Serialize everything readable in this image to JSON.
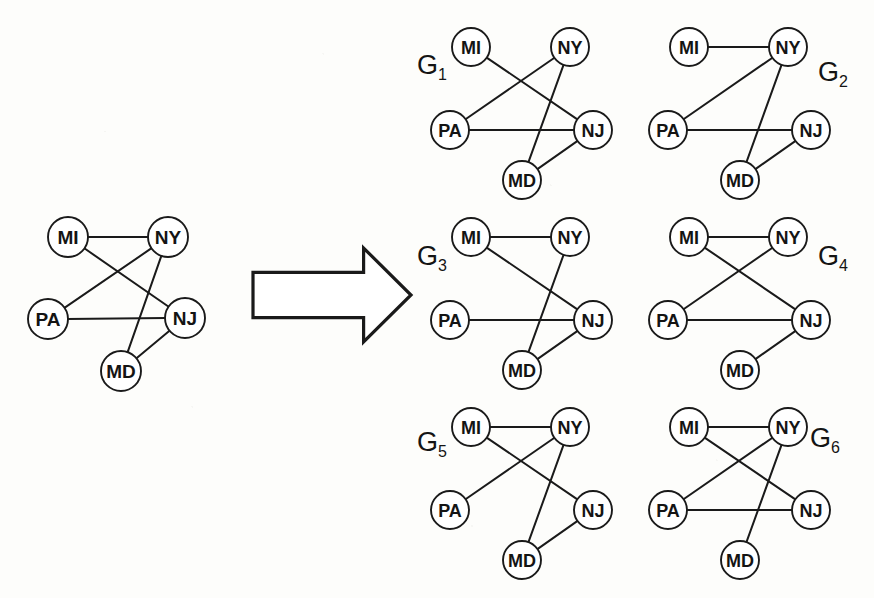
{
  "figure": {
    "background_color": "#fdfdfb",
    "ink_color": "#1a1a1a",
    "node_fill": "#ffffff",
    "node_radius": 20,
    "node_radius_small": 19
  },
  "arrow": {
    "name": "block-arrow-right",
    "label": "",
    "x": 253,
    "y": 248,
    "width": 158,
    "height": 94
  },
  "nodes": {
    "MI": "MI",
    "NY": "NY",
    "PA": "PA",
    "NJ": "NJ",
    "MD": "MD"
  },
  "layout_source": {
    "MI": [
      68,
      237
    ],
    "NY": [
      168,
      237
    ],
    "PA": [
      48,
      319
    ],
    "NJ": [
      185,
      318
    ],
    "MD": [
      121,
      371
    ]
  },
  "layout_small": {
    "MI": [
      52,
      34
    ],
    "NY": [
      151,
      34
    ],
    "PA": [
      31,
      117
    ],
    "NJ": [
      174,
      117
    ],
    "MD": [
      103,
      167
    ]
  },
  "source_graph": {
    "name": "source-graph",
    "label": "",
    "origin": [
      0,
      0
    ],
    "edges": [
      [
        "MI",
        "NY"
      ],
      [
        "MI",
        "NJ"
      ],
      [
        "PA",
        "NY"
      ],
      [
        "PA",
        "NJ"
      ],
      [
        "NY",
        "MD"
      ],
      [
        "NJ",
        "MD"
      ]
    ]
  },
  "result_graphs": [
    {
      "id": "G1",
      "label_main": "G",
      "label_sub": "1",
      "label_pos": [
        432,
        74
      ],
      "origin": [
        419,
        13
      ],
      "deleted_edge": [
        "MI",
        "NY"
      ],
      "edges": [
        [
          "MI",
          "NJ"
        ],
        [
          "PA",
          "NY"
        ],
        [
          "PA",
          "NJ"
        ],
        [
          "NY",
          "MD"
        ],
        [
          "NJ",
          "MD"
        ]
      ]
    },
    {
      "id": "G2",
      "label_main": "G",
      "label_sub": "2",
      "label_pos": [
        833,
        81
      ],
      "origin": [
        637,
        13
      ],
      "deleted_edge": [
        "MI",
        "NJ"
      ],
      "edges": [
        [
          "MI",
          "NY"
        ],
        [
          "PA",
          "NY"
        ],
        [
          "PA",
          "NJ"
        ],
        [
          "NY",
          "MD"
        ],
        [
          "NJ",
          "MD"
        ]
      ]
    },
    {
      "id": "G3",
      "label_main": "G",
      "label_sub": "3",
      "label_pos": [
        432,
        265
      ],
      "origin": [
        419,
        203
      ],
      "deleted_edge": [
        "PA",
        "NY"
      ],
      "edges": [
        [
          "MI",
          "NY"
        ],
        [
          "MI",
          "NJ"
        ],
        [
          "PA",
          "NJ"
        ],
        [
          "NY",
          "MD"
        ],
        [
          "NJ",
          "MD"
        ]
      ]
    },
    {
      "id": "G4",
      "label_main": "G",
      "label_sub": "4",
      "label_pos": [
        833,
        265
      ],
      "origin": [
        637,
        203
      ],
      "deleted_edge": [
        "NY",
        "MD"
      ],
      "edges": [
        [
          "MI",
          "NY"
        ],
        [
          "MI",
          "NJ"
        ],
        [
          "PA",
          "NY"
        ],
        [
          "PA",
          "NJ"
        ],
        [
          "NJ",
          "MD"
        ]
      ]
    },
    {
      "id": "G5",
      "label_main": "G",
      "label_sub": "5",
      "label_pos": [
        432,
        451
      ],
      "origin": [
        419,
        393
      ],
      "deleted_edge": [
        "PA",
        "NJ"
      ],
      "edges": [
        [
          "MI",
          "NY"
        ],
        [
          "MI",
          "NJ"
        ],
        [
          "PA",
          "NY"
        ],
        [
          "NY",
          "MD"
        ],
        [
          "NJ",
          "MD"
        ]
      ]
    },
    {
      "id": "G6",
      "label_main": "G",
      "label_sub": "6",
      "label_pos": [
        825,
        447
      ],
      "origin": [
        637,
        393
      ],
      "deleted_edge": [
        "NJ",
        "MD"
      ],
      "edges": [
        [
          "MI",
          "NY"
        ],
        [
          "MI",
          "NJ"
        ],
        [
          "PA",
          "NY"
        ],
        [
          "PA",
          "NJ"
        ],
        [
          "NY",
          "MD"
        ]
      ]
    }
  ]
}
